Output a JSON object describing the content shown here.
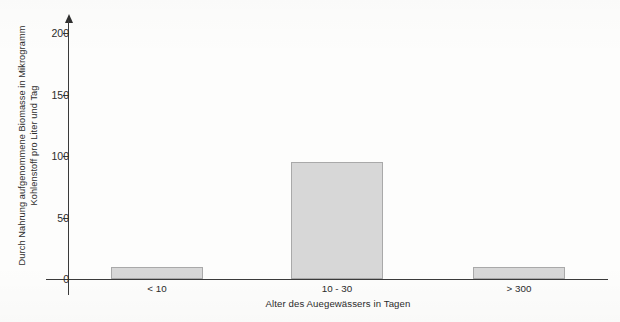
{
  "chart_data": {
    "type": "bar",
    "title": "",
    "subtitle": "",
    "xlabel": "Alter des Auegewässers in Tagen",
    "ylabel_line1": "Durch Nahrung aufgenommene Biomasse in Mikrogramm",
    "ylabel_line2": "Kohlenstoff pro Liter und Tag",
    "ylabel": "Durch Nahrung aufgenommene Biomasse in Mikrogramm Kohlenstoff pro Liter und Tag",
    "categories": [
      "< 10",
      "10 - 30",
      "> 300"
    ],
    "values": [
      10,
      95,
      10
    ],
    "ylim": [
      0,
      200
    ],
    "yticks": [
      0,
      50,
      100,
      150,
      200
    ],
    "ytick_labels": [
      "0",
      "50",
      "100",
      "150",
      "200"
    ],
    "grid": false,
    "legend": false,
    "legend_position": "none",
    "bar_fill_color": "#d7d7d7",
    "bar_border_color": "#a9a9a9",
    "axis_color": "#3a3a3a",
    "background_color": "#fdfdfc",
    "text_color": "#2b2b2b"
  }
}
